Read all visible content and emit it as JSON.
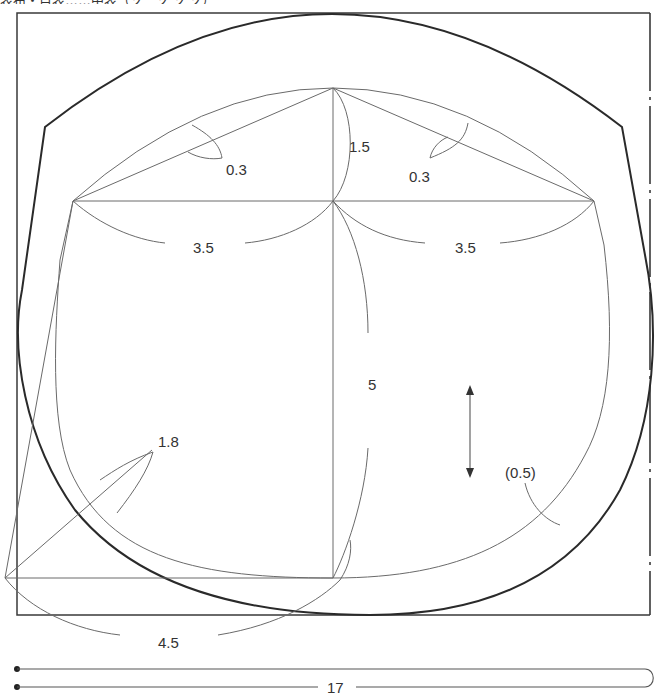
{
  "header": {
    "title_text": "表布・目表……中表（ソ　ソ ソ ソ）"
  },
  "diagram": {
    "type": "sewing-pattern",
    "labels": {
      "dart_left": "0.3",
      "dart_right": "0.3",
      "apex_height": "1.5",
      "half_width_left": "3.5",
      "half_width_right": "3.5",
      "center_height": "5",
      "corner_diagonal": "1.8",
      "seam_allowance": "(0.5)",
      "bottom_radius": "4.5",
      "strip_length": "17"
    },
    "grainline": "double-headed vertical arrow",
    "fold_line": "dash-dot line on right edge",
    "colors": {
      "line": "#6a6a6a",
      "cut_line": "#2a2a2a",
      "background": "#ffffff"
    }
  }
}
